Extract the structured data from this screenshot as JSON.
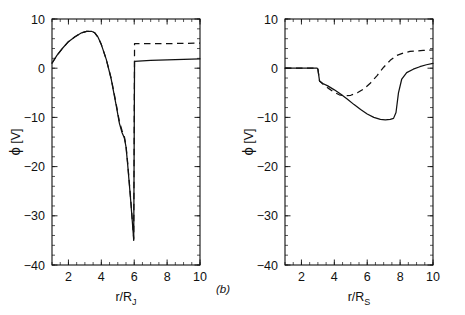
{
  "figure": {
    "panel_tag_b": "(b)",
    "stroke_color": "#111111",
    "background": "#ffffff"
  },
  "chart_data": [
    {
      "id": "panel-a",
      "type": "line",
      "title": "",
      "xlabel": "r/R_J",
      "xlabel_main": "r/R",
      "xlabel_sub": "J",
      "ylabel": "ϕ [V]",
      "ylabel_symbol": "ϕ",
      "ylabel_unit": "[V]",
      "xlim": [
        1,
        10
      ],
      "ylim": [
        -40,
        10
      ],
      "xticks": [
        2,
        4,
        6,
        8,
        10
      ],
      "xtick_labels": [
        "2",
        "4",
        "6",
        "8",
        "10"
      ],
      "yticks": [
        10,
        0,
        -10,
        -20,
        -30,
        -40
      ],
      "ytick_labels": [
        "10",
        "0",
        "-10",
        "-20",
        "-30",
        "-40"
      ],
      "x_minor_step": 0.5,
      "y_minor_step": 2,
      "grid": false,
      "legend": "none",
      "series": [
        {
          "name": "solid",
          "style": "solid",
          "x": [
            1.0,
            1.3,
            1.6,
            2.0,
            2.4,
            2.8,
            3.1,
            3.4,
            3.6,
            3.8,
            4.0,
            4.3,
            4.6,
            4.9,
            5.1,
            5.25,
            5.4,
            5.5,
            5.6,
            5.7,
            5.8,
            5.88,
            5.94,
            5.97,
            5.97,
            6.02,
            6.5,
            7.0,
            8.0,
            9.0,
            10.0
          ],
          "y": [
            1.0,
            2.6,
            3.9,
            5.4,
            6.4,
            7.2,
            7.5,
            7.5,
            7.2,
            6.3,
            4.8,
            1.8,
            -2.2,
            -7.5,
            -11.2,
            -13.0,
            -14.2,
            -16.0,
            -19.5,
            -23.5,
            -27.5,
            -31.0,
            -33.6,
            -35.0,
            -35.0,
            1.4,
            1.5,
            1.6,
            1.7,
            1.8,
            1.9
          ]
        },
        {
          "name": "dashed",
          "style": "dashed",
          "x": [
            1.0,
            1.3,
            1.6,
            2.0,
            2.4,
            2.8,
            3.1,
            3.4,
            3.6,
            3.8,
            4.0,
            4.3,
            4.6,
            4.9,
            5.1,
            5.25,
            5.4,
            5.5,
            5.6,
            5.7,
            5.8,
            5.88,
            5.94,
            5.97,
            5.97,
            6.02,
            6.5,
            7.0,
            8.0,
            9.0,
            10.0
          ],
          "y": [
            1.0,
            2.6,
            3.9,
            5.4,
            6.4,
            7.2,
            7.5,
            7.5,
            7.2,
            6.3,
            4.8,
            1.8,
            -2.1,
            -7.2,
            -10.9,
            -12.6,
            -13.9,
            -15.7,
            -19.2,
            -23.2,
            -27.2,
            -30.7,
            -33.3,
            -34.7,
            -34.7,
            5.0,
            5.0,
            5.0,
            5.0,
            5.05,
            5.1
          ]
        }
      ],
      "annotations": {
        "peak_value": 7.5,
        "peak_x": 3.4,
        "minimum_value": -35.0,
        "minimum_x": 5.97,
        "discontinuity_x": 6.0,
        "solid_plateau": 1.5,
        "dashed_plateau": 5.0
      }
    },
    {
      "id": "panel-b",
      "type": "line",
      "title": "",
      "xlabel": "r/R_S",
      "xlabel_main": "r/R",
      "xlabel_sub": "S",
      "ylabel": "ϕ [V]",
      "ylabel_symbol": "ϕ",
      "ylabel_unit": "[V]",
      "xlim": [
        1,
        10
      ],
      "ylim": [
        -40,
        10
      ],
      "xticks": [
        2,
        4,
        6,
        8,
        10
      ],
      "xtick_labels": [
        "2",
        "4",
        "6",
        "8",
        "10"
      ],
      "yticks": [
        10,
        0,
        -10,
        -20,
        -30,
        -40
      ],
      "ytick_labels": [
        "10",
        "0",
        "-10",
        "-20",
        "-30",
        "-40"
      ],
      "x_minor_step": 0.5,
      "y_minor_step": 2,
      "grid": false,
      "legend": "none",
      "series": [
        {
          "name": "solid",
          "style": "solid",
          "x": [
            1.0,
            2.0,
            2.8,
            2.95,
            3.0,
            3.1,
            3.3,
            3.6,
            4.0,
            4.4,
            4.8,
            5.2,
            5.6,
            6.0,
            6.4,
            6.8,
            7.1,
            7.4,
            7.6,
            7.75,
            7.9,
            8.1,
            8.4,
            8.8,
            9.2,
            9.6,
            10.0
          ],
          "y": [
            0.0,
            0.0,
            0.0,
            0.0,
            -0.2,
            -2.6,
            -3.1,
            -3.6,
            -4.4,
            -5.3,
            -6.3,
            -7.4,
            -8.4,
            -9.3,
            -10.0,
            -10.4,
            -10.5,
            -10.4,
            -10.2,
            -9.0,
            -5.0,
            -2.2,
            -0.9,
            -0.2,
            0.3,
            0.7,
            1.0
          ]
        },
        {
          "name": "dashed",
          "style": "dashed",
          "x": [
            1.0,
            2.0,
            2.8,
            2.95,
            3.0,
            3.1,
            3.3,
            3.6,
            4.0,
            4.3,
            4.6,
            5.0,
            5.4,
            5.8,
            6.2,
            6.6,
            7.0,
            7.4,
            7.8,
            8.2,
            8.6,
            9.0,
            9.4,
            10.0
          ],
          "y": [
            0.0,
            0.0,
            0.0,
            0.0,
            -0.2,
            -2.6,
            -3.2,
            -4.0,
            -4.9,
            -5.4,
            -5.6,
            -5.5,
            -5.0,
            -4.2,
            -3.0,
            -1.5,
            0.2,
            1.6,
            2.6,
            3.1,
            3.4,
            3.5,
            3.6,
            3.7
          ]
        }
      ],
      "annotations": {
        "onset_x": 3.0,
        "solid_minimum_value": -10.5,
        "solid_minimum_x": 7.1,
        "dashed_minimum_value": -5.6,
        "dashed_minimum_x": 4.6,
        "solid_end_value": 1.0,
        "dashed_end_value": 3.7
      }
    }
  ]
}
